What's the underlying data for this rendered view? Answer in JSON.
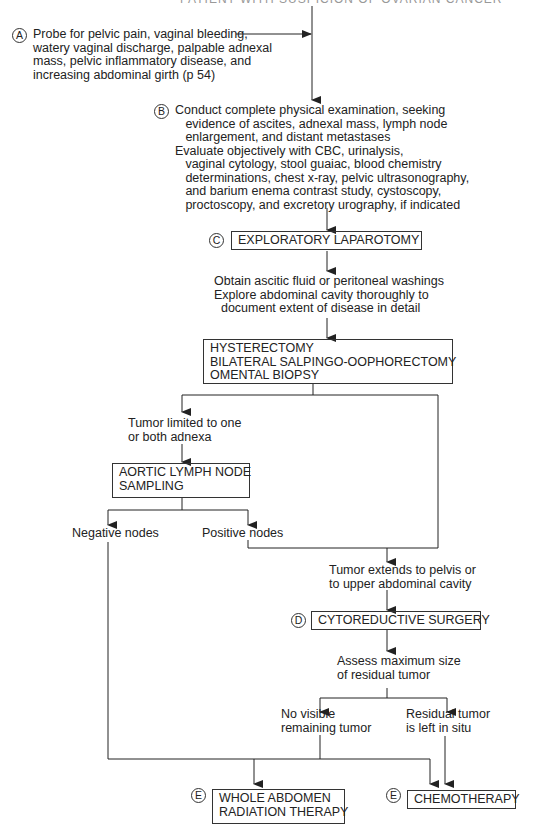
{
  "title": "PATIENT WITH SUSPICION OF OVARIAN CANCER",
  "nodes": {
    "A": {
      "marker": "A",
      "text": "Probe for pelvic pain, vaginal bleeding,\nwatery vaginal discharge, palpable adnexal\nmass, pelvic inflammatory disease, and\nincreasing abdominal girth (p 54)"
    },
    "B": {
      "marker": "B",
      "text": "Conduct complete physical examination, seeking\n   evidence of ascites, adnexal mass, lymph node\n   enlargement, and distant metastases\nEvaluate objectively with CBC, urinalysis,\n   vaginal cytology, stool guaiac, blood chemistry\n   determinations, chest x-ray, pelvic ultrasonography,\n   and barium enema contrast study, cystoscopy,\n   proctoscopy, and excretory urography, if indicated"
    },
    "C": {
      "marker": "C",
      "label": "EXPLORATORY LAPAROTOMY"
    },
    "obtain": {
      "text": "Obtain ascitic fluid or peritoneal washings\nExplore abdominal cavity thoroughly to\n  document extent of disease in detail"
    },
    "surgery": {
      "label": "HYSTERECTOMY\nBILATERAL SALPINGO-OOPHORECTOMY\nOMENTAL BIOPSY"
    },
    "limited": {
      "text": "Tumor limited to one\nor both adnexa"
    },
    "aortic": {
      "label": "AORTIC LYMPH NODE\nSAMPLING"
    },
    "negative": {
      "text": "Negative nodes"
    },
    "positive": {
      "text": "Positive nodes"
    },
    "extends": {
      "text": "Tumor extends to pelvis or\nto upper abdominal cavity"
    },
    "D": {
      "marker": "D",
      "label": "CYTOREDUCTIVE SURGERY"
    },
    "assess": {
      "text": "Assess maximum size\nof residual tumor"
    },
    "novisible": {
      "text": "No visible\nremaining tumor"
    },
    "residual": {
      "text": "Residual tumor\nis left in situ"
    },
    "E1": {
      "marker": "E",
      "label": "WHOLE ABDOMEN\nRADIATION THERAPY"
    },
    "E2": {
      "marker": "E",
      "label": "CHEMOTHERAPY"
    }
  }
}
